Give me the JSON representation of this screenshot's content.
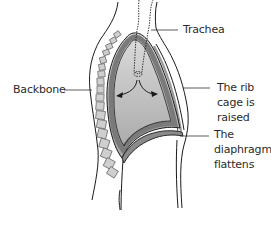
{
  "diagram": {
    "labels": {
      "trachea": "Trachea",
      "backbone": "Backbone",
      "rib_cage": [
        "The rib",
        "cage is",
        "raised"
      ],
      "diaphragm": [
        "The",
        "diaphragm",
        "flattens"
      ]
    },
    "colors": {
      "lung_fill_top": "#d9d9d9",
      "lung_fill_bottom": "#a8a8a8",
      "lung_border": "#7a7a7a",
      "outline": "#1a1a1a",
      "vertebra_fill": "#cfcfcf",
      "vertebra_stroke": "#6e6e6e",
      "leader_line": "#333333"
    }
  }
}
